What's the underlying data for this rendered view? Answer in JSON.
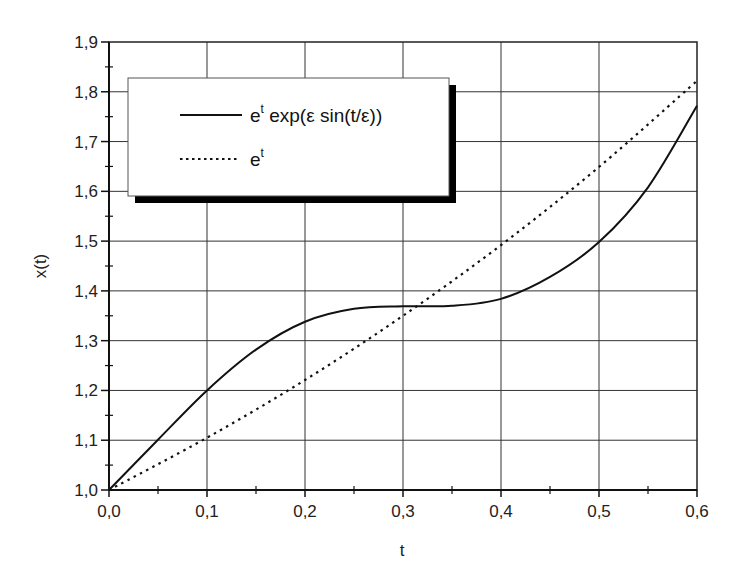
{
  "chart_data": {
    "type": "line",
    "title": "",
    "xlabel": "t",
    "ylabel": "x(t)",
    "xlim": [
      0.0,
      0.6
    ],
    "ylim": [
      1.0,
      1.9
    ],
    "grid": true,
    "legend_position": "upper left",
    "x_ticks": [
      "0,0",
      "0,1",
      "0,2",
      "0,3",
      "0,4",
      "0,5",
      "0,6"
    ],
    "y_ticks": [
      "1,0",
      "1,1",
      "1,2",
      "1,3",
      "1,4",
      "1,5",
      "1,6",
      "1,7",
      "1,8",
      "1,9"
    ],
    "series": [
      {
        "name": "e^t exp(ε sin(t/ε))",
        "style": "solid",
        "x": [
          0.0,
          0.05,
          0.1,
          0.15,
          0.2,
          0.25,
          0.3,
          0.35,
          0.4,
          0.45,
          0.5,
          0.55,
          0.6
        ],
        "values": [
          1.0,
          1.101,
          1.2,
          1.282,
          1.338,
          1.364,
          1.369,
          1.37,
          1.384,
          1.428,
          1.498,
          1.608,
          1.772
        ]
      },
      {
        "name": "e^t",
        "style": "dotted",
        "x": [
          0.0,
          0.1,
          0.2,
          0.3,
          0.4,
          0.5,
          0.6
        ],
        "values": [
          1.0,
          1.105,
          1.221,
          1.35,
          1.492,
          1.649,
          1.822
        ]
      }
    ]
  },
  "legend": {
    "entry1": {
      "base": "e",
      "sup": "t",
      "rest": " exp(ε sin(t/ε))"
    },
    "entry2": {
      "base": "e",
      "sup": "t"
    }
  }
}
